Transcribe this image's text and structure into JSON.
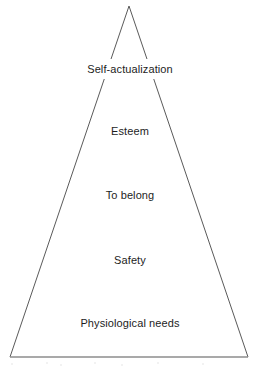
{
  "diagram": {
    "name": "Maslow's hierarchy of needs pyramid",
    "shape": "triangle",
    "stroke_color": "#5a5a5a",
    "base_stroke_color": "#8d8d8d",
    "fill_color": "#ffffff",
    "background_color": "#ffffff",
    "text_color": "#1d1d1d",
    "geometry": {
      "apex_x": 129,
      "apex_y": 6,
      "bottom_left_x": 10,
      "bottom_left_y": 357,
      "bottom_right_x": 248,
      "bottom_right_y": 357
    },
    "tiers": [
      {
        "label": "Self-actualization",
        "level": 5,
        "center_y": 66
      },
      {
        "label": "Esteem",
        "level": 4,
        "center_y": 128
      },
      {
        "label": "To belong",
        "level": 3,
        "center_y": 192
      },
      {
        "label": "Safety",
        "level": 2,
        "center_y": 257
      },
      {
        "label": "Physiological needs",
        "level": 1,
        "center_y": 320
      }
    ]
  }
}
